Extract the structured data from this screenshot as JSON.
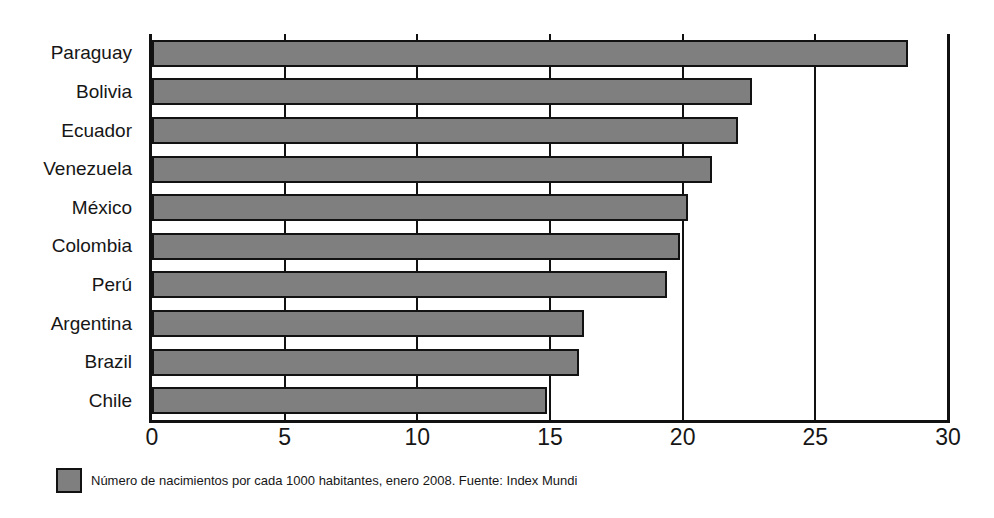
{
  "chart_data": {
    "type": "bar",
    "orientation": "horizontal",
    "title": "",
    "subtitle": "",
    "xlabel": "",
    "ylabel": "",
    "categories": [
      "Paraguay",
      "Bolivia",
      "Ecuador",
      "Venezuela",
      "México",
      "Colombia",
      "Perú",
      "Argentina",
      "Brazil",
      "Chile"
    ],
    "values": [
      28.5,
      22.6,
      22.1,
      21.1,
      20.2,
      19.9,
      19.4,
      16.3,
      16.1,
      14.9
    ],
    "series": [
      {
        "name": "Número de nacimientos por cada 1000 habitantes, enero 2008",
        "values": [
          28.5,
          22.6,
          22.1,
          21.1,
          20.2,
          19.9,
          19.4,
          16.3,
          16.1,
          14.9
        ]
      }
    ],
    "xlim": [
      0,
      30
    ],
    "xticks": [
      0,
      5,
      10,
      15,
      20,
      25,
      30
    ],
    "xtick_labels": [
      "0",
      "5",
      "10",
      "15",
      "20",
      "25",
      "30"
    ],
    "gridlines": [
      5,
      10,
      15,
      20,
      25,
      30
    ],
    "grid": true,
    "legend_position": "bottom-left",
    "bar_color": "#7f7f7f",
    "bar_border_color": "#121212",
    "axis_color": "#111111",
    "background": "#ffffff"
  },
  "legend": {
    "swatch_color": "#7f7f7f",
    "caption": "Número de nacimientos por cada 1000 habitantes, enero 2008. Fuente: Index Mundi"
  }
}
